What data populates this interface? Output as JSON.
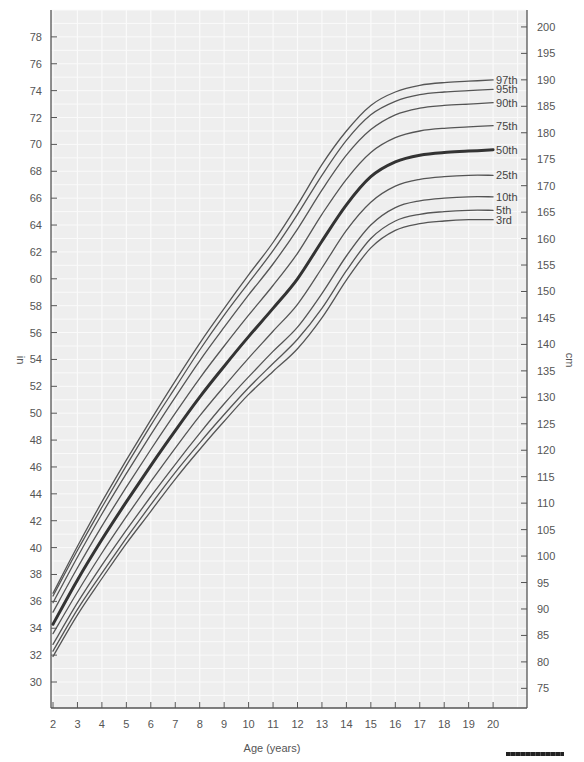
{
  "chart_data": {
    "type": "line",
    "title": "",
    "xlabel": "Age (years)",
    "ylabel": "in",
    "ylabel_right": "cm",
    "xlim": [
      2,
      21.4
    ],
    "ylim_in": [
      28.1,
      80.0
    ],
    "x_ticks": [
      2,
      3,
      4,
      5,
      6,
      7,
      8,
      9,
      10,
      11,
      12,
      13,
      14,
      15,
      16,
      17,
      18,
      19,
      20
    ],
    "y_ticks_in": [
      30,
      32,
      34,
      36,
      38,
      40,
      42,
      44,
      46,
      48,
      50,
      52,
      54,
      56,
      58,
      60,
      62,
      64,
      66,
      68,
      70,
      72,
      74,
      76,
      78
    ],
    "y_ticks_cm": [
      75,
      80,
      85,
      90,
      95,
      100,
      105,
      110,
      115,
      120,
      125,
      130,
      135,
      140,
      145,
      150,
      155,
      160,
      165,
      170,
      175,
      180,
      185,
      190,
      195,
      200
    ],
    "grid": true,
    "legend_position": "inline-right",
    "x": [
      2,
      3,
      4,
      5,
      6,
      7,
      8,
      9,
      10,
      11,
      12,
      13,
      14,
      15,
      16,
      17,
      18,
      19,
      20
    ],
    "series": [
      {
        "name": "3rd",
        "emphasis": false,
        "values": [
          31.9,
          35.0,
          37.7,
          40.3,
          42.7,
          45.1,
          47.3,
          49.4,
          51.4,
          53.1,
          54.8,
          57.1,
          59.9,
          62.3,
          63.6,
          64.1,
          64.3,
          64.4,
          64.4
        ]
      },
      {
        "name": "5th",
        "emphasis": false,
        "values": [
          32.3,
          35.4,
          38.1,
          40.7,
          43.2,
          45.6,
          47.8,
          49.9,
          51.9,
          53.7,
          55.5,
          57.8,
          60.6,
          63.0,
          64.3,
          64.8,
          65.0,
          65.1,
          65.1
        ]
      },
      {
        "name": "10th",
        "emphasis": false,
        "values": [
          32.8,
          35.9,
          38.7,
          41.3,
          43.8,
          46.2,
          48.5,
          50.7,
          52.7,
          54.6,
          56.4,
          58.9,
          61.7,
          64.0,
          65.3,
          65.8,
          66.0,
          66.1,
          66.1
        ]
      },
      {
        "name": "25th",
        "emphasis": false,
        "values": [
          33.6,
          36.7,
          39.6,
          42.3,
          44.9,
          47.4,
          49.8,
          52.0,
          54.1,
          56.1,
          58.1,
          60.8,
          63.6,
          65.7,
          66.9,
          67.4,
          67.6,
          67.7,
          67.7
        ]
      },
      {
        "name": "50th",
        "emphasis": true,
        "values": [
          34.3,
          37.6,
          40.6,
          43.4,
          46.1,
          48.7,
          51.2,
          53.5,
          55.7,
          57.8,
          60.0,
          62.8,
          65.5,
          67.6,
          68.7,
          69.2,
          69.4,
          69.5,
          69.6
        ]
      },
      {
        "name": "75th",
        "emphasis": false,
        "values": [
          35.2,
          38.5,
          41.6,
          44.5,
          47.3,
          50.0,
          52.6,
          55.0,
          57.3,
          59.5,
          61.9,
          64.8,
          67.4,
          69.4,
          70.5,
          71.0,
          71.2,
          71.3,
          71.4
        ]
      },
      {
        "name": "90th",
        "emphasis": false,
        "values": [
          35.9,
          39.3,
          42.5,
          45.5,
          48.4,
          51.2,
          53.9,
          56.4,
          58.8,
          61.1,
          63.7,
          66.6,
          69.2,
          71.1,
          72.2,
          72.7,
          72.9,
          73.0,
          73.1
        ]
      },
      {
        "name": "95th",
        "emphasis": false,
        "values": [
          36.4,
          39.8,
          43.0,
          46.1,
          49.1,
          51.9,
          54.7,
          57.3,
          59.7,
          62.1,
          64.8,
          67.7,
          70.3,
          72.2,
          73.2,
          73.7,
          73.9,
          74.0,
          74.1
        ]
      },
      {
        "name": "97th",
        "emphasis": false,
        "values": [
          36.6,
          40.1,
          43.4,
          46.5,
          49.5,
          52.4,
          55.2,
          57.8,
          60.3,
          62.7,
          65.5,
          68.5,
          71.0,
          72.9,
          73.9,
          74.4,
          74.6,
          74.7,
          74.8
        ]
      }
    ],
    "colors": {
      "plot_bg": "#eeeeee",
      "grid": "#fafafa",
      "line": "#555555",
      "line_emphasis": "#333333",
      "axis": "#555555"
    }
  }
}
